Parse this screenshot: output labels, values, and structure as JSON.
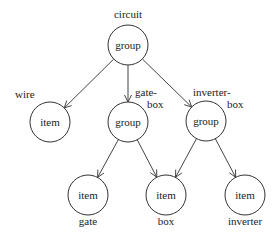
{
  "diagram": {
    "nodes": [
      {
        "id": "circuit",
        "type": "group",
        "name": "circuit",
        "cx": 128,
        "cy": 45,
        "r": 20,
        "labelLines": [
          "circuit"
        ],
        "labelX": 128,
        "labelY": 18,
        "labelAnchor": "middle"
      },
      {
        "id": "wire",
        "type": "item",
        "name": "wire",
        "cx": 50,
        "cy": 122,
        "r": 20,
        "labelLines": [
          "wire"
        ],
        "labelX": 15,
        "labelY": 98,
        "labelAnchor": "start"
      },
      {
        "id": "gate-box",
        "type": "group",
        "name": "gate-box",
        "cx": 128,
        "cy": 122,
        "r": 20,
        "labelLines": [
          "gate-",
          "box"
        ],
        "labelX": 135,
        "labelY": 96,
        "labelAnchor": "start",
        "line2X": 147
      },
      {
        "id": "inverter-box",
        "type": "group",
        "name": "inverter-box",
        "cx": 206,
        "cy": 121,
        "r": 20,
        "labelLines": [
          "inverter-",
          "box"
        ],
        "labelX": 193,
        "labelY": 96,
        "labelAnchor": "start",
        "line2X": 227
      },
      {
        "id": "gate",
        "type": "item",
        "name": "gate",
        "cx": 88,
        "cy": 195,
        "r": 20,
        "labelLines": [
          "gate"
        ],
        "labelX": 88,
        "labelY": 225,
        "labelAnchor": "middle"
      },
      {
        "id": "box",
        "type": "item",
        "name": "box",
        "cx": 166,
        "cy": 195,
        "r": 20,
        "labelLines": [
          "box"
        ],
        "labelX": 166,
        "labelY": 225,
        "labelAnchor": "middle"
      },
      {
        "id": "inverter",
        "type": "item",
        "name": "inverter",
        "cx": 245,
        "cy": 195,
        "r": 20,
        "labelLines": [
          "inverter"
        ],
        "labelX": 245,
        "labelY": 225,
        "labelAnchor": "middle"
      }
    ],
    "edges": [
      {
        "from": "circuit",
        "to": "wire"
      },
      {
        "from": "circuit",
        "to": "gate-box"
      },
      {
        "from": "circuit",
        "to": "inverter-box"
      },
      {
        "from": "gate-box",
        "to": "gate"
      },
      {
        "from": "gate-box",
        "to": "box"
      },
      {
        "from": "inverter-box",
        "to": "box"
      },
      {
        "from": "inverter-box",
        "to": "inverter"
      }
    ]
  }
}
